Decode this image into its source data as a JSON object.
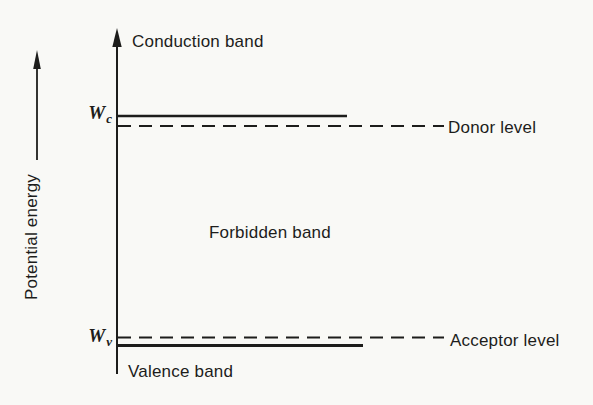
{
  "meta": {
    "background_color": "#f9f9f6",
    "ink_color": "#1d1d1b"
  },
  "diagram": {
    "y_axis_label": "Potential energy",
    "conduction_band": "Conduction band",
    "forbidden_band": "Forbidden band",
    "valence_band": "Valence band",
    "donor_level": "Donor level",
    "acceptor_level": "Acceptor level",
    "wc": {
      "base": "W",
      "sub": "c"
    },
    "wv": {
      "base": "W",
      "sub": "v"
    }
  }
}
